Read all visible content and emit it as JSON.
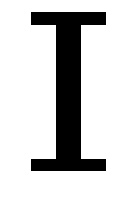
{
  "icon": {
    "name": "text-cursor-ibeam",
    "color": "#000000",
    "background": "#ffffff"
  }
}
